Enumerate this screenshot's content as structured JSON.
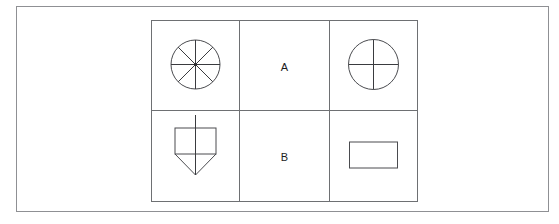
{
  "page": {
    "background_color": "#ffffff",
    "frame_border_color": "#8f9094",
    "line_color": "#4a4b4f"
  },
  "figure_table": {
    "name": "two-by-three-figure-grid",
    "rows": [
      {
        "label": "A",
        "left_shape": {
          "name": "circle-eight-sectors",
          "description": "circle divided into eight equal sectors by four diameters",
          "sectors": 8
        },
        "right_shape": {
          "name": "circle-four-sectors",
          "description": "circle divided into four equal sectors by vertical and horizontal diameters",
          "sectors": 4
        }
      },
      {
        "label": "B",
        "left_shape": {
          "name": "rectangle-with-triangle-and-axis",
          "description": "rectangle with a downward pointing triangle attached below and a vertical line through the centre",
          "sectors": 0
        },
        "right_shape": {
          "name": "plain-rectangle",
          "description": "plain empty rectangle",
          "sectors": 0
        }
      }
    ]
  }
}
